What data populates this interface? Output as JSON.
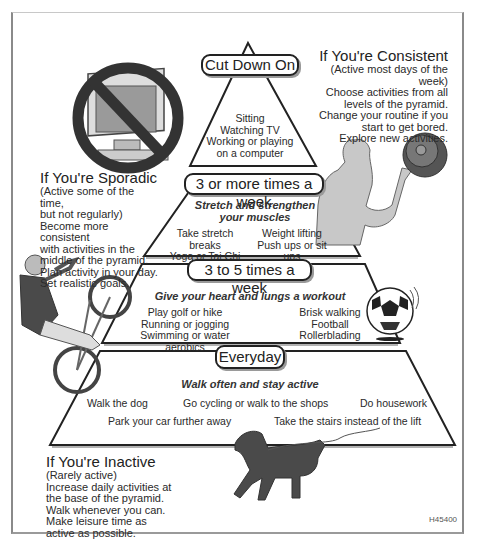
{
  "pyramid": {
    "tiers": [
      {
        "label": "Cut Down On",
        "activities": [
          "Sitting",
          "Watching TV",
          "Working or playing",
          "on a computer"
        ]
      },
      {
        "label": "3 or more times a week",
        "heading_line1": "Stretch and strengthen",
        "heading_line2": "your muscles",
        "left": [
          "Take stretch breaks",
          "Yoga or Tai Chi"
        ],
        "right": [
          "Weight lifting",
          "Push ups or sit ups"
        ]
      },
      {
        "label": "3 to 5 times a week",
        "heading": "Give your heart and lungs a workout",
        "left": [
          "Play golf or hike",
          "Running or jogging",
          "Swimming or water aerobics"
        ],
        "right": [
          "Brisk walking",
          "Football",
          "Rollerblading"
        ]
      },
      {
        "label": "Everyday",
        "heading": "Walk often and stay active",
        "row1": [
          "Walk the dog",
          "Go cycling or walk to the shops",
          "Do housework"
        ],
        "row2": [
          "Park your car further away",
          "Take the stairs instead of the lift"
        ]
      }
    ]
  },
  "notes": {
    "consistent": {
      "title": "If You're Consistent",
      "lines": [
        "(Active most days of the week)",
        "Choose activities from all",
        "levels of the pyramid.",
        "Change your routine if you",
        "start to get bored.",
        "Explore new activities."
      ]
    },
    "sporadic": {
      "title": "If You're Sporadic",
      "lines": [
        "(Active some of the time,",
        "but not regularly)",
        "Become more consistent",
        "with activities in the",
        "middle of the pyramid.",
        "Plan activity in your day.",
        "Set realistic goals."
      ]
    },
    "inactive": {
      "title": "If You're Inactive",
      "lines": [
        "(Rarely active)",
        "Increase daily activities at",
        "the base of the pyramid.",
        "Walk whenever you can.",
        "Make leisure time as",
        "active as possible."
      ]
    }
  },
  "illustrations": {
    "no_computer": "no-computer-icon",
    "weightlifter": "weightlifter-illustration",
    "cyclist": "cyclist-illustration",
    "football": "football-icon",
    "dog": "dog-illustration"
  },
  "figure_code": "H45400",
  "colors": {
    "line": "#222222",
    "figure_fill": "#c8c8c8",
    "dark_fill": "#4a4a4a"
  }
}
